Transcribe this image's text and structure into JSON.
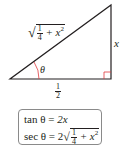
{
  "diagram": {
    "type": "right-triangle",
    "colors": {
      "stroke": "#231f20",
      "angle_mark": "#e0393e",
      "right_angle_mark": "#e0393e",
      "box_border": "#8a8a8a"
    },
    "hypotenuse_label": {
      "sqrt_prefix": "√",
      "frac_num": "1",
      "frac_den": "4",
      "rest": "+ x",
      "exp": "2"
    },
    "opposite_label": "x",
    "adjacent_label": {
      "num": "1",
      "den": "2"
    },
    "angle_label": "θ"
  },
  "formulas": {
    "line1": {
      "lhs": "tan θ = ",
      "rhs": "2x"
    },
    "line2": {
      "lhs": "sec θ = 2",
      "frac_num": "1",
      "frac_den": "4",
      "rest": "+ x",
      "exp": "2"
    }
  }
}
